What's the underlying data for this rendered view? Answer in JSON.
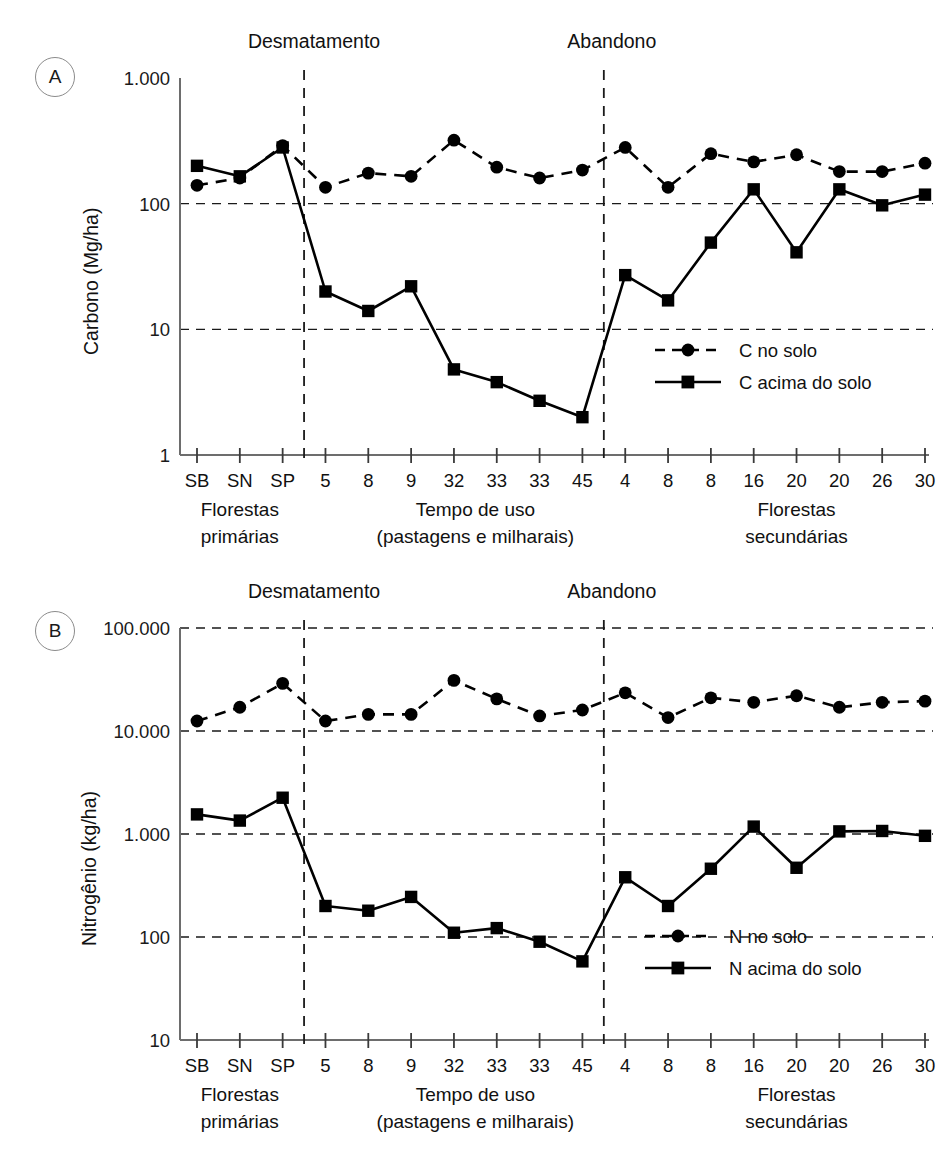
{
  "figure": {
    "panels": [
      {
        "badge": "A",
        "ylabel": "Carbono (Mg/ha)",
        "yticks": [
          "1.000",
          "100",
          "10",
          "1"
        ],
        "events": [
          "Desmatamento",
          "Abandono"
        ],
        "legend": [
          {
            "label": "C no solo",
            "style": "dashed-circle"
          },
          {
            "label": "C acima do solo",
            "style": "solid-square"
          }
        ]
      },
      {
        "badge": "B",
        "ylabel": "Nitrogênio (kg/ha)",
        "yticks": [
          "100.000",
          "10.000",
          "1.000",
          "100",
          "10"
        ],
        "events": [
          "Desmatamento",
          "Abandono"
        ],
        "legend": [
          {
            "label": "N no solo",
            "style": "dashed-circle"
          },
          {
            "label": "N acima do solo",
            "style": "solid-square"
          }
        ]
      }
    ],
    "xticks": [
      "SB",
      "SN",
      "SP",
      "5",
      "8",
      "9",
      "32",
      "33",
      "33",
      "45",
      "4",
      "8",
      "8",
      "16",
      "20",
      "20",
      "26",
      "30"
    ],
    "groups": [
      {
        "line1": "Florestas",
        "line2": "primárias"
      },
      {
        "line1": "Tempo de uso",
        "line2": "(pastagens e milharais)"
      },
      {
        "line1": "Florestas",
        "line2": "secundárias"
      }
    ]
  },
  "chart_data": [
    {
      "type": "line",
      "panel": "A",
      "title": "",
      "xlabel": "",
      "ylabel": "Carbono (Mg/ha)",
      "yscale": "log",
      "ylim": [
        1,
        1000
      ],
      "yticks": [
        1,
        10,
        100,
        1000
      ],
      "ytick_labels": [
        "1",
        "10",
        "100",
        "1.000"
      ],
      "grid": "horizontal-dashed",
      "legend_position": "inside-bottom-right",
      "categories": [
        "SB",
        "SN",
        "SP",
        "5",
        "8",
        "9",
        "32",
        "33",
        "33",
        "45",
        "4",
        "8",
        "8",
        "16",
        "20",
        "20",
        "26",
        "30"
      ],
      "annotations": [
        {
          "text": "Desmatamento",
          "at_category_index": 2.5,
          "type": "vertical-dashed-line"
        },
        {
          "text": "Abandono",
          "at_category_index": 9.5,
          "type": "vertical-dashed-line"
        }
      ],
      "series": [
        {
          "name": "C no solo",
          "marker": "circle",
          "linestyle": "dashed",
          "values": [
            140,
            160,
            290,
            135,
            175,
            165,
            320,
            195,
            160,
            185,
            280,
            135,
            250,
            215,
            245,
            180,
            180,
            210
          ]
        },
        {
          "name": "C acima do solo",
          "marker": "square",
          "linestyle": "solid",
          "values": [
            200,
            165,
            280,
            20,
            14,
            22,
            4.8,
            3.8,
            2.7,
            2.0,
            27,
            17,
            49,
            130,
            41,
            130,
            97,
            118
          ]
        }
      ]
    },
    {
      "type": "line",
      "panel": "B",
      "title": "",
      "xlabel": "",
      "ylabel": "Nitrogênio (kg/ha)",
      "yscale": "log",
      "ylim": [
        10,
        100000
      ],
      "yticks": [
        10,
        100,
        1000,
        10000,
        100000
      ],
      "ytick_labels": [
        "10",
        "100",
        "1.000",
        "10.000",
        "100.000"
      ],
      "grid": "horizontal-dashed",
      "legend_position": "inside-bottom-right",
      "categories": [
        "SB",
        "SN",
        "SP",
        "5",
        "8",
        "9",
        "32",
        "33",
        "33",
        "45",
        "4",
        "8",
        "8",
        "16",
        "20",
        "20",
        "26",
        "30"
      ],
      "annotations": [
        {
          "text": "Desmatamento",
          "at_category_index": 2.5,
          "type": "vertical-dashed-line"
        },
        {
          "text": "Abandono",
          "at_category_index": 9.5,
          "type": "vertical-dashed-line"
        }
      ],
      "series": [
        {
          "name": "N no solo",
          "marker": "circle",
          "linestyle": "dashed",
          "values": [
            12500,
            17000,
            29000,
            12500,
            14500,
            14500,
            31000,
            20500,
            14000,
            16000,
            23500,
            13500,
            21000,
            19000,
            22000,
            17000,
            19000,
            19500
          ]
        },
        {
          "name": "N acima do solo",
          "marker": "square",
          "linestyle": "solid",
          "values": [
            1550,
            1350,
            2250,
            200,
            180,
            245,
            110,
            122,
            90,
            58,
            380,
            200,
            460,
            1180,
            470,
            1060,
            1070,
            960
          ]
        }
      ]
    }
  ]
}
